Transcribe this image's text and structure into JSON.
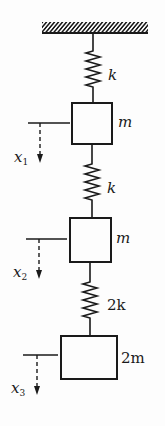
{
  "diagram": {
    "colors": {
      "ink": "#1a1a1a",
      "background": "#fdfdfd"
    },
    "support": {
      "type": "fixed-ceiling",
      "icon": "hatched-ground"
    },
    "springs": [
      {
        "id": "spring-1",
        "label": "k"
      },
      {
        "id": "spring-2",
        "label": "k"
      },
      {
        "id": "spring-3",
        "label": "2k"
      }
    ],
    "masses": [
      {
        "id": "mass-1",
        "label": "m"
      },
      {
        "id": "mass-2",
        "label": "m"
      },
      {
        "id": "mass-3",
        "label": "2m"
      }
    ],
    "coordinates": [
      {
        "id": "x1",
        "symbol": "x",
        "subscript": "1",
        "direction": "down"
      },
      {
        "id": "x2",
        "symbol": "x",
        "subscript": "2",
        "direction": "down"
      },
      {
        "id": "x3",
        "symbol": "x",
        "subscript": "3",
        "direction": "down"
      }
    ]
  }
}
